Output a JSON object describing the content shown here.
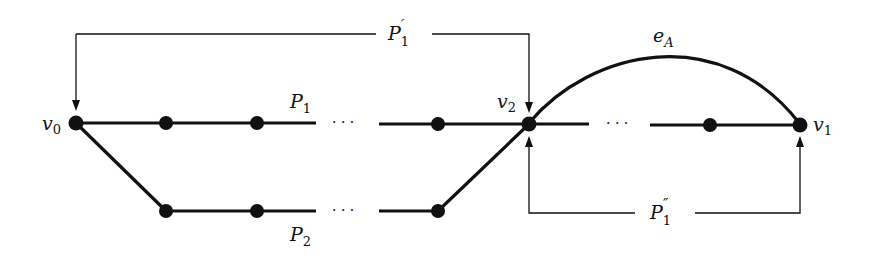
{
  "diagram": {
    "type": "graph-paths",
    "colors": {
      "ink": "#111111",
      "background": "#ffffff"
    },
    "vertices": {
      "v0": {
        "label": "v",
        "sub": "0"
      },
      "v1": {
        "label": "v",
        "sub": "1"
      },
      "v2": {
        "label": "v",
        "sub": "2"
      }
    },
    "paths": {
      "P1": {
        "label": "P",
        "sub": "1"
      },
      "P2": {
        "label": "P",
        "sub": "2"
      }
    },
    "brackets": {
      "P1_prime": {
        "label": "P",
        "sub": "1",
        "prime": "′"
      },
      "P1_double_prime": {
        "label": "P",
        "sub": "1",
        "prime": "″"
      }
    },
    "edge": {
      "label": "e",
      "sub": "A"
    },
    "ellipsis": "· · ·"
  }
}
